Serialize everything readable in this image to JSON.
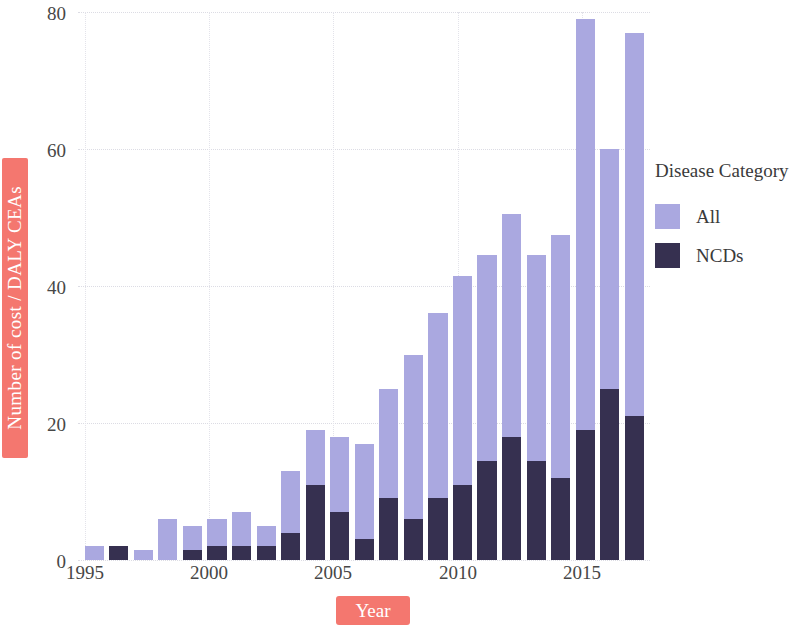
{
  "colors": {
    "all": "#aaa8e0",
    "ncds": "#363050",
    "highlight": "#f4776f",
    "highlight_text": "#ffffff",
    "grid": "#dcdce4",
    "text": "#474747",
    "background": "#ffffff"
  },
  "axes": {
    "ylabel": "Number of cost / DALY CEAs",
    "xlabel": "Year",
    "yticks": [
      "0",
      "20",
      "40",
      "60",
      "80"
    ],
    "xticks": [
      "1995",
      "2000",
      "2005",
      "2010",
      "2015"
    ]
  },
  "legend": {
    "title": "Disease Category",
    "items": [
      {
        "label": "All",
        "color": "#aaa8e0"
      },
      {
        "label": "NCDs",
        "color": "#363050"
      }
    ]
  },
  "chart_data": {
    "type": "bar",
    "title": "",
    "subtitle": "",
    "xlabel": "Year",
    "ylabel": "Number of cost / DALY CEAs",
    "stacked": true,
    "grid": true,
    "legend_position": "right",
    "legend_title": "Disease Category",
    "ylim": [
      0,
      80
    ],
    "yticks": [
      0,
      20,
      40,
      60,
      80
    ],
    "xticks": [
      1995,
      2000,
      2005,
      2010,
      2015
    ],
    "categories": [
      1995,
      1996,
      1997,
      1998,
      1999,
      2000,
      2001,
      2002,
      2003,
      2004,
      2005,
      2006,
      2007,
      2008,
      2009,
      2010,
      2011,
      2012,
      2013,
      2014,
      2015,
      2016,
      2017
    ],
    "series": [
      {
        "name": "All",
        "color": "#aaa8e0",
        "values": [
          2,
          2,
          1.5,
          6,
          5,
          6,
          7,
          5,
          13,
          19,
          18,
          17,
          25,
          30,
          36,
          41.5,
          44.5,
          50.5,
          44.5,
          47.5,
          79,
          60,
          77
        ]
      },
      {
        "name": "NCDs",
        "color": "#363050",
        "values": [
          0,
          2,
          0,
          0,
          1.5,
          2,
          2,
          2,
          4,
          11,
          7,
          3,
          9,
          6,
          9,
          11,
          14.5,
          18,
          14.5,
          12,
          19,
          25,
          21
        ]
      }
    ]
  }
}
